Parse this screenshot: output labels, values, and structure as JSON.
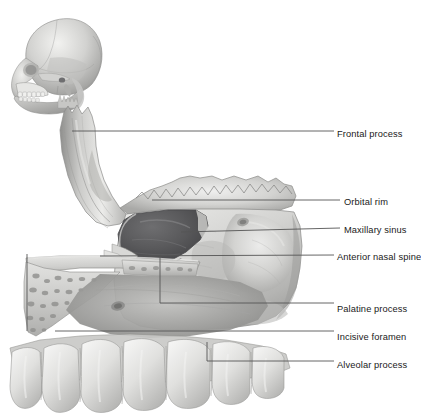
{
  "figure": {
    "type": "anatomical-illustration",
    "style": "grayscale airbrush medical illustration",
    "inset": {
      "name": "skull-lateral-inset",
      "description": "Lateral view of human skull, orientation key"
    },
    "colors": {
      "leader_line": "#555555",
      "label_text": "#1a1a1a",
      "bone_light": "#e8e8e6",
      "bone_mid": "#c2c2c0",
      "bone_shadow": "#8e8e8c",
      "sinus_cavity": "#5a5a5c",
      "tooth_enamel": "#e4e4e2",
      "background": "#ffffff"
    }
  },
  "labels": [
    {
      "id": "frontal-process",
      "text": "Frontal process",
      "text_x": 337,
      "text_y": 135,
      "line": {
        "x1": 72,
        "y1": 131,
        "x2": 334,
        "y2": 131
      }
    },
    {
      "id": "orbital-rim",
      "text": "Orbital rim",
      "text_x": 344,
      "text_y": 203,
      "line": {
        "x1": 152,
        "y1": 200,
        "x2": 340,
        "y2": 200
      }
    },
    {
      "id": "maxillary-sinus",
      "text": "Maxillary sinus",
      "text_x": 344,
      "text_y": 231,
      "line": {
        "x1": 181,
        "y1": 232,
        "x2": 340,
        "y2": 228
      }
    },
    {
      "id": "anterior-nasal-spine",
      "text": "Anterior nasal spine",
      "text_x": 337,
      "text_y": 258,
      "line": {
        "x1": 100,
        "y1": 256,
        "x2": 334,
        "y2": 255
      }
    },
    {
      "id": "palatine-process",
      "text": "Palatine process",
      "text_x": 337,
      "text_y": 310,
      "line": {
        "x1": 160,
        "y1": 303,
        "x2": 334,
        "y2": 303
      }
    },
    {
      "id": "incisive-foramen",
      "text": "Incisive foramen",
      "text_x": 337,
      "text_y": 338,
      "line": {
        "x1": 55,
        "y1": 331,
        "x2": 334,
        "y2": 331
      }
    },
    {
      "id": "alveolar-process",
      "text": "Alveolar process",
      "text_x": 337,
      "text_y": 366,
      "line": {
        "x1": 207,
        "y1": 361,
        "x2": 334,
        "y2": 361
      }
    }
  ],
  "brackets": [
    {
      "id": "palatine-bracket",
      "x": 160,
      "y_top": 256,
      "y_bottom": 303
    },
    {
      "id": "left-bone-bracket",
      "x": 27,
      "y_top": 254,
      "y_bottom": 331
    },
    {
      "id": "alveolar-bracket",
      "x": 207,
      "y_top": 342,
      "y_bottom": 361
    }
  ]
}
